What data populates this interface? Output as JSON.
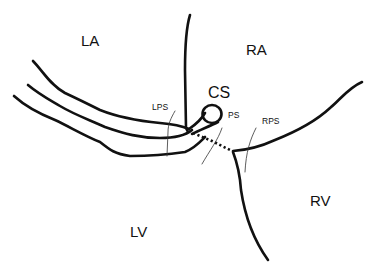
{
  "diagram": {
    "type": "cardiac anatomy schematic",
    "labels": {
      "la": "LA",
      "ra": "RA",
      "cs": "CS",
      "lps": "LPS",
      "ps": "PS",
      "rps": "RPS",
      "lv": "LV",
      "rv": "RV"
    },
    "colors": {
      "line": "#111111",
      "background": "#ffffff"
    }
  }
}
